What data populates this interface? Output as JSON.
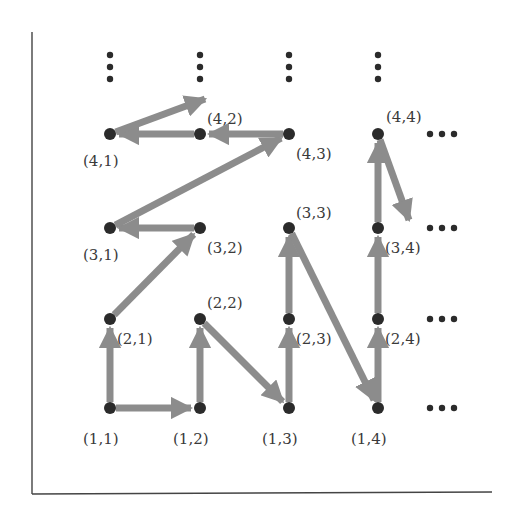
{
  "diagram": {
    "title": "",
    "colors": {
      "arrow": "#8c8c8c",
      "node": "#2b2b2b",
      "axis": "#444444",
      "label": "#3a3a3a",
      "background": "#ffffff"
    },
    "columns_x": [
      110,
      200,
      289,
      378
    ],
    "rows_y": [
      408,
      319,
      228,
      134
    ],
    "nodes": [
      {
        "id": "1,1",
        "label": "(1,1)",
        "x": 110,
        "y": 408,
        "lx": 83,
        "ly": 444
      },
      {
        "id": "1,2",
        "label": "(1,2)",
        "x": 200,
        "y": 408,
        "lx": 173,
        "ly": 444
      },
      {
        "id": "1,3",
        "label": "(1,3)",
        "x": 289,
        "y": 408,
        "lx": 262,
        "ly": 444
      },
      {
        "id": "1,4",
        "label": "(1,4)",
        "x": 378,
        "y": 408,
        "lx": 351,
        "ly": 444
      },
      {
        "id": "2,1",
        "label": "(2,1)",
        "x": 110,
        "y": 319,
        "lx": 117,
        "ly": 344
      },
      {
        "id": "2,2",
        "label": "(2,2)",
        "x": 200,
        "y": 319,
        "lx": 207,
        "ly": 308
      },
      {
        "id": "2,3",
        "label": "(2,3)",
        "x": 289,
        "y": 319,
        "lx": 296,
        "ly": 344
      },
      {
        "id": "2,4",
        "label": "(2,4)",
        "x": 378,
        "y": 319,
        "lx": 385,
        "ly": 344
      },
      {
        "id": "3,1",
        "label": "(3,1)",
        "x": 110,
        "y": 228,
        "lx": 83,
        "ly": 260
      },
      {
        "id": "3,2",
        "label": "(3,2)",
        "x": 200,
        "y": 228,
        "lx": 207,
        "ly": 253
      },
      {
        "id": "3,3",
        "label": "(3,3)",
        "x": 289,
        "y": 228,
        "lx": 296,
        "ly": 218
      },
      {
        "id": "3,4",
        "label": "(3,4)",
        "x": 378,
        "y": 228,
        "lx": 385,
        "ly": 253
      },
      {
        "id": "4,1",
        "label": "(4,1)",
        "x": 110,
        "y": 134,
        "lx": 83,
        "ly": 166
      },
      {
        "id": "4,2",
        "label": "(4,2)",
        "x": 200,
        "y": 134,
        "lx": 207,
        "ly": 124
      },
      {
        "id": "4,3",
        "label": "(4,3)",
        "x": 289,
        "y": 134,
        "lx": 296,
        "ly": 159
      },
      {
        "id": "4,4",
        "label": "(4,4)",
        "x": 378,
        "y": 134,
        "lx": 386,
        "ly": 122
      }
    ],
    "edges": [
      {
        "from": "1,1",
        "to": "2,1"
      },
      {
        "from": "1,1",
        "to": "1,2"
      },
      {
        "from": "1,2",
        "to": "2,2"
      },
      {
        "from": "2,2",
        "to": "1,3"
      },
      {
        "from": "1,3",
        "to": "2,3"
      },
      {
        "from": "2,3",
        "to": "3,3"
      },
      {
        "from": "3,3",
        "to": "1,4"
      },
      {
        "from": "1,4",
        "to": "2,4"
      },
      {
        "from": "2,4",
        "to": "3,4"
      },
      {
        "from": "3,4",
        "to": "4,4"
      },
      {
        "from": "2,1",
        "to": "3,2"
      },
      {
        "from": "3,2",
        "to": "3,1"
      },
      {
        "from": "3,1",
        "to": "4,3"
      },
      {
        "from": "4,3",
        "to": "4,2"
      },
      {
        "from": "4,2",
        "to": "4,1"
      }
    ],
    "open_edges": [
      {
        "from": "4,1",
        "to_x": 205,
        "to_y": 99,
        "note": "continues up-right beyond (4,2)"
      },
      {
        "from": "4,4",
        "to_x": 409,
        "to_y": 220,
        "note": "continues down-right toward next column"
      }
    ],
    "vertical_ellipses": [
      {
        "x": 110,
        "y": 60
      },
      {
        "x": 200,
        "y": 60
      },
      {
        "x": 289,
        "y": 60
      },
      {
        "x": 378,
        "y": 60
      }
    ],
    "horizontal_ellipses": [
      {
        "x": 440,
        "y": 134
      },
      {
        "x": 440,
        "y": 228
      },
      {
        "x": 440,
        "y": 319
      },
      {
        "x": 440,
        "y": 408
      }
    ],
    "ellipsis_vertical_symbol": "⋮",
    "ellipsis_horizontal_symbol": "⋯",
    "axes": {
      "left": {
        "x": 32,
        "y1": 32,
        "y2": 494
      },
      "bottom": {
        "y": 494,
        "x1": 32,
        "x2": 492
      }
    }
  }
}
